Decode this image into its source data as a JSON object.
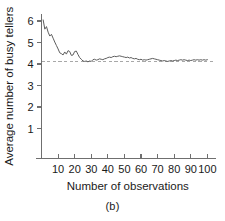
{
  "chart_data": {
    "type": "line",
    "title": "",
    "subtitle": "",
    "xlabel": "Number of observations",
    "ylabel": "Average number of busy tellers",
    "caption": "(b)",
    "xlim": [
      0,
      104
    ],
    "ylim": [
      0,
      6.35
    ],
    "xticks": [
      10,
      20,
      30,
      40,
      50,
      60,
      70,
      80,
      90,
      100
    ],
    "yticks": [
      1,
      2,
      3,
      4,
      5,
      6
    ],
    "xtick_labels": [
      "10",
      "20",
      "30",
      "40",
      "50",
      "60",
      "70",
      "80",
      "90",
      "100"
    ],
    "ytick_labels": [
      "1",
      "2",
      "3",
      "4",
      "5",
      "6"
    ],
    "grid": false,
    "legend": false,
    "legend_position": "none",
    "series": [
      {
        "name": "cumulative average busy tellers",
        "color": "#5d5d5d",
        "style": "solid",
        "x": [
          1,
          2,
          3,
          4,
          5,
          6,
          7,
          8,
          9,
          10,
          11,
          12,
          13,
          14,
          15,
          16,
          17,
          18,
          19,
          20,
          21,
          22,
          23,
          24,
          25,
          26,
          27,
          28,
          29,
          30,
          31,
          32,
          33,
          34,
          35,
          36,
          37,
          38,
          39,
          40,
          41,
          42,
          43,
          44,
          45,
          46,
          47,
          48,
          49,
          50,
          51,
          52,
          53,
          54,
          55,
          56,
          57,
          58,
          59,
          60,
          61,
          62,
          63,
          64,
          65,
          66,
          67,
          68,
          69,
          70,
          71,
          72,
          73,
          74,
          75,
          76,
          77,
          78,
          79,
          80,
          81,
          82,
          83,
          84,
          85,
          86,
          87,
          88,
          89,
          90,
          91,
          92,
          93,
          94,
          95,
          96,
          97,
          98,
          99,
          100
        ],
        "values": [
          6.05,
          5.62,
          5.74,
          5.48,
          5.3,
          5.38,
          5.2,
          5.02,
          4.86,
          4.7,
          4.52,
          4.48,
          4.42,
          4.56,
          4.46,
          4.62,
          4.58,
          4.4,
          4.42,
          4.58,
          4.6,
          4.44,
          4.3,
          4.22,
          4.14,
          4.12,
          4.14,
          4.1,
          4.14,
          4.12,
          4.2,
          4.22,
          4.18,
          4.2,
          4.24,
          4.22,
          4.2,
          4.24,
          4.26,
          4.3,
          4.32,
          4.3,
          4.34,
          4.36,
          4.34,
          4.36,
          4.38,
          4.36,
          4.34,
          4.32,
          4.3,
          4.32,
          4.28,
          4.3,
          4.26,
          4.24,
          4.26,
          4.22,
          4.2,
          4.22,
          4.18,
          4.2,
          4.18,
          4.2,
          4.22,
          4.24,
          4.26,
          4.24,
          4.22,
          4.2,
          4.18,
          4.16,
          4.14,
          4.16,
          4.14,
          4.12,
          4.14,
          4.16,
          4.14,
          4.16,
          4.18,
          4.16,
          4.18,
          4.2,
          4.18,
          4.2,
          4.18,
          4.16,
          4.18,
          4.16,
          4.18,
          4.2,
          4.18,
          4.2,
          4.18,
          4.2,
          4.18,
          4.2,
          4.18,
          4.2
        ]
      }
    ],
    "reference_line": {
      "name": "steady-state reference",
      "orientation": "horizontal",
      "value": 4.1,
      "style": "dashed",
      "color": "#a8a8a8"
    }
  }
}
